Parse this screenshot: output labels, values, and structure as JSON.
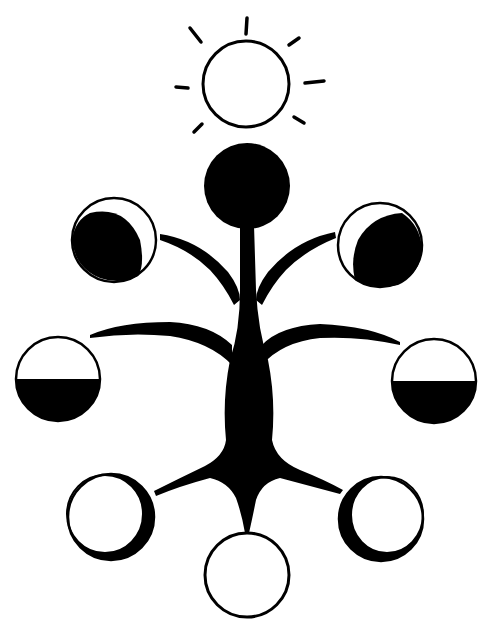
{
  "diagram": {
    "title": "Tree of moon phases with sun",
    "colors": {
      "ink": "#000000",
      "paper": "#ffffff"
    },
    "sun": {
      "label": "sun",
      "cx": 246,
      "cy": 84,
      "r": 43,
      "rays": 8
    },
    "moons": [
      {
        "id": "new-moon",
        "label": "new moon",
        "cx": 247,
        "cy": 186,
        "r": 43,
        "phase": "new"
      },
      {
        "id": "waxing-crescent-left",
        "label": "crescent (lit right edge)",
        "cx": 114,
        "cy": 240,
        "r": 42,
        "phase": "crescent-left"
      },
      {
        "id": "waning-crescent-right",
        "label": "crescent (lit left edge)",
        "cx": 380,
        "cy": 245,
        "r": 42,
        "phase": "crescent-right"
      },
      {
        "id": "half-moon-left",
        "label": "half moon (lower dark)",
        "cx": 58,
        "cy": 379,
        "r": 43,
        "phase": "half"
      },
      {
        "id": "half-moon-right",
        "label": "half moon (lower dark)",
        "cx": 434,
        "cy": 381,
        "r": 43,
        "phase": "half"
      },
      {
        "id": "gibbous-left",
        "label": "gibbous (dark right edge)",
        "cx": 111,
        "cy": 517,
        "r": 44,
        "phase": "gibbous-left"
      },
      {
        "id": "gibbous-right",
        "label": "gibbous (dark left edge)",
        "cx": 381,
        "cy": 519,
        "r": 42,
        "phase": "gibbous-right"
      },
      {
        "id": "full-moon",
        "label": "full moon",
        "cx": 247,
        "cy": 575,
        "r": 42,
        "phase": "full"
      }
    ],
    "tree": {
      "label": "tree trunk and branches"
    }
  }
}
